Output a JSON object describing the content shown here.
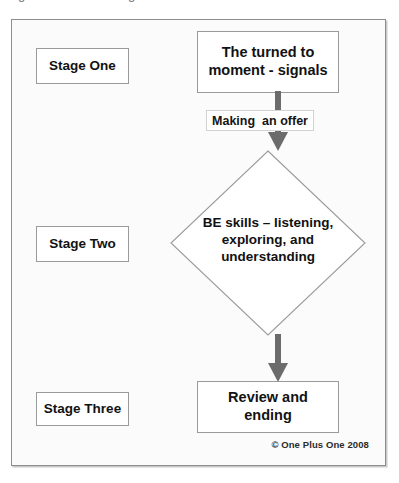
{
  "figure": {
    "cutoff_text_above": [
      "g",
      "g"
    ],
    "colors": {
      "background": "#fbfbfb",
      "frame_border": "#8d8d8d",
      "node_border": "#9a9a9a",
      "arrow": "#6b6b6b",
      "label_border": "#d2d2d2",
      "text": "#111111"
    }
  },
  "stages": [
    {
      "label": "Stage One"
    },
    {
      "label": "Stage Two"
    },
    {
      "label": "Stage Three"
    }
  ],
  "nodes": {
    "top_box": {
      "line1": "The turned to",
      "line2": "moment - signals"
    },
    "diamond": {
      "line1": "BE skills – listening,",
      "line2": "exploring, and",
      "line3": "understanding"
    },
    "bottom_box": {
      "label": "Review and ending"
    }
  },
  "edges": {
    "label_top": {
      "part1": "Making",
      "part2": "an offer",
      "full": "Making an offer"
    },
    "arrow_one": "down-arrow",
    "arrow_two": "down-arrow"
  },
  "footer": {
    "copyright": "© One Plus One 2008"
  }
}
